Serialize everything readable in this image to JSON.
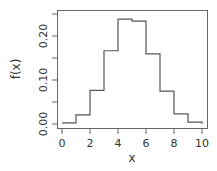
{
  "chart_data": {
    "type": "line",
    "style": "step",
    "title": "",
    "xlabel": "x",
    "ylabel": "f(x)",
    "xlim": [
      0,
      10
    ],
    "ylim": [
      0,
      0.25
    ],
    "x_ticks": [
      "0",
      "2",
      "4",
      "6",
      "8",
      "10"
    ],
    "y_ticks": [
      "0.00",
      "0.10",
      "0.20"
    ],
    "y_minor_ticks": [
      0.05,
      0.15,
      0.25
    ],
    "grid": false,
    "legend": null,
    "series": [
      {
        "name": "f(x)",
        "x": [
          0,
          1,
          2,
          3,
          4,
          5,
          6,
          7,
          8,
          9,
          10
        ],
        "values": [
          0.0025,
          0.0207,
          0.0763,
          0.1665,
          0.2384,
          0.234,
          0.1596,
          0.0746,
          0.0229,
          0.0042,
          0.0003
        ]
      }
    ],
    "colors": {
      "line": "#555555",
      "axis": "#555555"
    }
  },
  "axes": {
    "xlabel": "x",
    "ylabel": "f(x)",
    "x_tick_labels": [
      "0",
      "2",
      "4",
      "6",
      "8",
      "10"
    ],
    "y_tick_labels": [
      "0.00",
      "0.10",
      "0.20"
    ]
  }
}
